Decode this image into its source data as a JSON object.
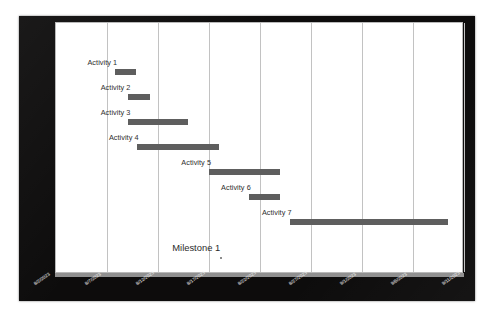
{
  "chart_data": {
    "type": "bar",
    "subtype": "gantt",
    "title": "",
    "xlabel": "",
    "ylabel": "",
    "grid": true,
    "legend": "none",
    "orientation": "horizontal",
    "bar_color": "#5e5e5e",
    "background_color": "#ffffff",
    "frame_color": "#0d0c0c",
    "gridline_color": "#c2c2c2",
    "axis_range": [
      "8/2/2023",
      "9/11/2023"
    ],
    "x_tick_labels": [
      "8/2/2023",
      "8/7/2023",
      "8/12/2023",
      "8/17/2023",
      "8/22/2023",
      "8/27/2023",
      "9/1/2023",
      "9/6/2023",
      "9/11/2023"
    ],
    "x_tick_days": [
      0,
      5,
      10,
      15,
      20,
      25,
      30,
      35,
      40
    ],
    "categories": [
      "Activity 1",
      "Activity 2",
      "Activity 3",
      "Activity 4",
      "Activity 5",
      "Activity 6",
      "Activity 7"
    ],
    "tasks": [
      {
        "label": "Activity 1",
        "start": "8/7/2023",
        "end": "8/10/2023",
        "start_day": 5.8,
        "end_day": 7.8,
        "duration_days": 2.0
      },
      {
        "label": "Activity 2",
        "start": "8/9/2023",
        "end": "8/11/2023",
        "start_day": 7.1,
        "end_day": 9.2,
        "duration_days": 2.1
      },
      {
        "label": "Activity 3",
        "start": "8/9/2023",
        "end": "8/15/2023",
        "start_day": 7.1,
        "end_day": 12.9,
        "duration_days": 5.8
      },
      {
        "label": "Activity 4",
        "start": "8/10/2023",
        "end": "8/18/2023",
        "start_day": 7.9,
        "end_day": 16.0,
        "duration_days": 8.1
      },
      {
        "label": "Activity 5",
        "start": "8/17/2023",
        "end": "8/24/2023",
        "start_day": 15.0,
        "end_day": 22.0,
        "duration_days": 7.0
      },
      {
        "label": "Activity 6",
        "start": "8/21/2023",
        "end": "8/24/2023",
        "start_day": 18.9,
        "end_day": 22.0,
        "duration_days": 3.1
      },
      {
        "label": "Activity 7",
        "start": "8/25/2023",
        "end": "9/9/2023",
        "start_day": 22.9,
        "end_day": 38.4,
        "duration_days": 15.5
      }
    ],
    "milestones": [
      {
        "label": "Milestone 1",
        "date": "8/18/2023",
        "day": 16.0
      }
    ]
  }
}
